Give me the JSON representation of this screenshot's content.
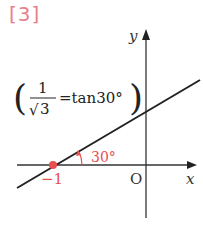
{
  "problem": {
    "number": "[3]"
  },
  "axes": {
    "x_label": "x",
    "y_label": "y",
    "origin_label": "O"
  },
  "annotation": {
    "numerator": "1",
    "denominator": "3",
    "sqrt": "√",
    "equals_text": "=tan30°",
    "open_paren": "(",
    "close_paren": ")"
  },
  "point": {
    "label": "−1",
    "color": "#e85050"
  },
  "angle": {
    "label": "30°",
    "color": "#e85050"
  },
  "colors": {
    "accent": "#e85050",
    "line": "#222222",
    "axis": "#333333"
  }
}
